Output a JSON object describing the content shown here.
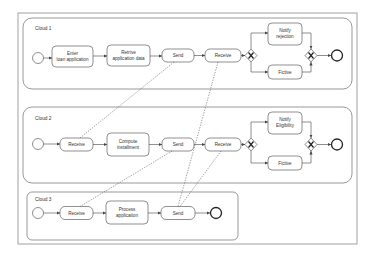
{
  "diagram": {
    "type": "bpmn-collaboration",
    "colors": {
      "stroke": "#444444",
      "frame": "#888888",
      "background": "#ffffff",
      "text": "#333333"
    },
    "pools": [
      {
        "id": "cloud1",
        "label": "Cloud 1",
        "tasks": [
          {
            "id": "c1_enter",
            "line1": "Enter",
            "line2": "loan application"
          },
          {
            "id": "c1_retrive",
            "line1": "Retrive",
            "line2": "application data"
          },
          {
            "id": "c1_send",
            "line1": "Send"
          },
          {
            "id": "c1_receive",
            "line1": "Receive"
          },
          {
            "id": "c1_notify",
            "line1": "Notify",
            "line2": "rejection"
          },
          {
            "id": "c1_fictive",
            "line1": "Fictive"
          }
        ]
      },
      {
        "id": "cloud2",
        "label": "Cloud 2",
        "tasks": [
          {
            "id": "c2_receive",
            "line1": "Receive"
          },
          {
            "id": "c2_compute",
            "line1": "Compute",
            "line2": "installment"
          },
          {
            "id": "c2_send",
            "line1": "Send"
          },
          {
            "id": "c2_receive2",
            "line1": "Receive"
          },
          {
            "id": "c2_notify",
            "line1": "Notify",
            "line2": "Eligibility"
          },
          {
            "id": "c2_fictive",
            "line1": "Fictive"
          }
        ]
      },
      {
        "id": "cloud3",
        "label": "Cloud 3",
        "tasks": [
          {
            "id": "c3_receive",
            "line1": "Receive"
          },
          {
            "id": "c3_process",
            "line1": "Process",
            "line2": "application"
          },
          {
            "id": "c3_send",
            "line1": "Send"
          }
        ]
      }
    ],
    "message_flows": [
      {
        "from": "c1_send",
        "to": "c2_receive"
      },
      {
        "from": "c1_receive",
        "to": "c3_send"
      },
      {
        "from": "c2_send",
        "to": "c3_receive"
      },
      {
        "from": "c2_receive2",
        "to": "c3_send"
      }
    ]
  }
}
